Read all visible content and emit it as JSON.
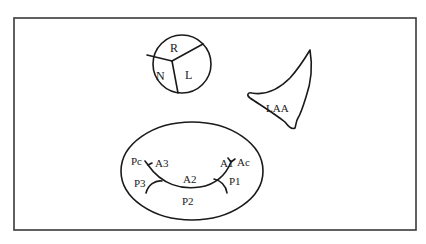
{
  "diagram": {
    "aortic_valve": {
      "cusps": [
        {
          "id": "right",
          "label": "R"
        },
        {
          "id": "left",
          "label": "L"
        },
        {
          "id": "non_coronary",
          "label": "N"
        }
      ]
    },
    "left_atrial_appendage": {
      "label": "LAA"
    },
    "mitral_valve": {
      "anterior_scallops": [
        "A1",
        "A2",
        "A3"
      ],
      "posterior_scallops": [
        "P1",
        "P2",
        "P3"
      ],
      "commissures": {
        "anterolateral": "Ac",
        "posteromedial": "Pc"
      }
    },
    "colors": {
      "stroke": "#1a1a1a",
      "frame": "#3a3a3a",
      "background": "#ffffff"
    }
  }
}
